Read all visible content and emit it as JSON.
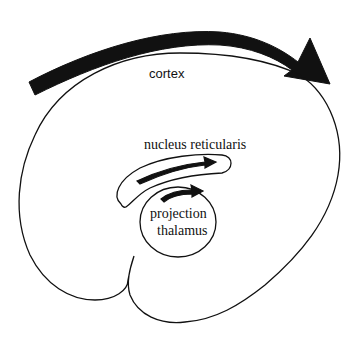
{
  "diagram": {
    "labels": {
      "cortex": "cortex",
      "nucleus_reticularis": "nucleus reticularis",
      "projection_thalamus_line1": "projection",
      "projection_thalamus_line2": "thalamus"
    },
    "colors": {
      "stroke": "#111111",
      "arrow_fill": "#111111",
      "background": "#ffffff"
    },
    "structures": [
      {
        "name": "cortex",
        "shape": "brain-outline",
        "arrow": "large curved arrow left-to-right above cortex"
      },
      {
        "name": "nucleus reticularis",
        "shape": "crescent",
        "arrow": "curved arrow left-to-right inside"
      },
      {
        "name": "projection thalamus",
        "shape": "ellipse",
        "arrow": "small curved arrow left-to-right inside"
      }
    ]
  }
}
